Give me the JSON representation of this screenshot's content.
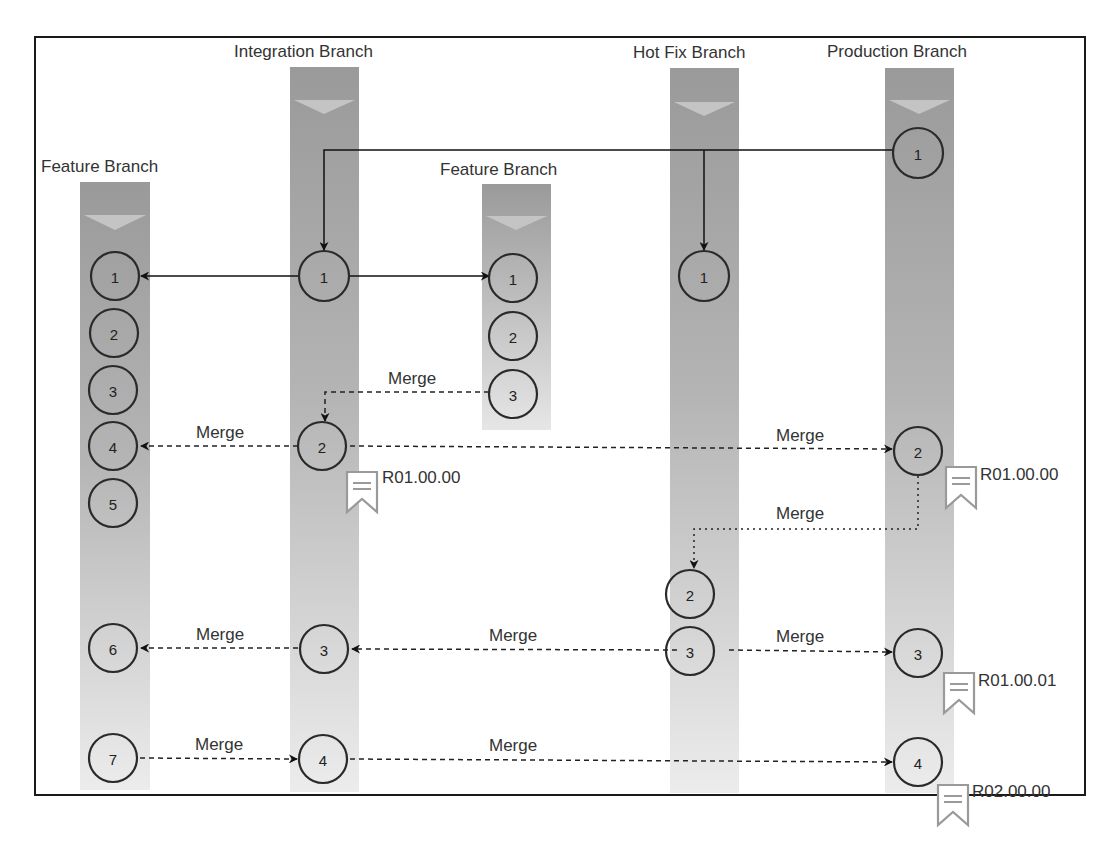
{
  "diagram": {
    "colors": {
      "frame": "#1a1a1a",
      "lane_top": "#9a9a9a",
      "lane_bottom": "#ececec",
      "chevron": "#c4c4c4",
      "node_stroke": "#2a2a2a",
      "arrow": "#111111",
      "tag_icon": "#9a9a9a",
      "text": "#333333"
    },
    "branches": [
      {
        "id": "feature_left",
        "label": "Feature Branch",
        "commits": [
          "1",
          "2",
          "3",
          "4",
          "5",
          "6",
          "7"
        ]
      },
      {
        "id": "integration",
        "label": "Integration Branch",
        "commits": [
          "1",
          "2",
          "3",
          "4"
        ]
      },
      {
        "id": "feature_mid",
        "label": "Feature Branch",
        "commits": [
          "1",
          "2",
          "3"
        ]
      },
      {
        "id": "hotfix",
        "label": "Hot Fix Branch",
        "commits": [
          "1",
          "2",
          "3"
        ]
      },
      {
        "id": "production",
        "label": "Production Branch",
        "commits": [
          "1",
          "2",
          "3",
          "4"
        ]
      }
    ],
    "merge_label": "Merge",
    "merges": [
      {
        "from": "feature_mid.3",
        "to": "integration.2",
        "label": "Merge",
        "style": "dashed"
      },
      {
        "from": "integration.2",
        "to": "feature_left.4",
        "label": "Merge",
        "style": "dashed"
      },
      {
        "from": "integration.2",
        "to": "production.2",
        "label": "Merge",
        "style": "dashed"
      },
      {
        "from": "production.2",
        "to": "hotfix.2",
        "label": "Merge",
        "style": "dotted"
      },
      {
        "from": "integration.3",
        "to": "feature_left.6",
        "label": "Merge",
        "style": "dashed"
      },
      {
        "from": "hotfix.3",
        "to": "integration.3",
        "label": "Merge",
        "style": "dashed"
      },
      {
        "from": "hotfix.3",
        "to": "production.3",
        "label": "Merge",
        "style": "dashed"
      },
      {
        "from": "feature_left.7",
        "to": "integration.4",
        "label": "Merge",
        "style": "dashed"
      },
      {
        "from": "integration.4",
        "to": "production.4",
        "label": "Merge",
        "style": "dashed"
      }
    ],
    "branch_offs": [
      {
        "from": "production.1",
        "to": "integration.1"
      },
      {
        "from": "production.1",
        "to": "hotfix.1"
      },
      {
        "from": "integration.1",
        "to": "feature_left.1"
      },
      {
        "from": "integration.1",
        "to": "feature_mid.1"
      }
    ],
    "tags": [
      {
        "on": "integration.2",
        "label": "R01.00.00"
      },
      {
        "on": "production.2",
        "label": "R01.00.00"
      },
      {
        "on": "production.3",
        "label": "R01.00.01"
      },
      {
        "on": "production.4",
        "label": "R02.00.00"
      }
    ]
  }
}
